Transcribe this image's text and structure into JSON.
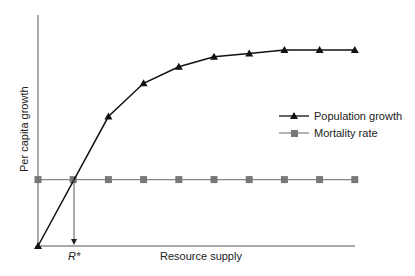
{
  "chart_data": {
    "type": "line",
    "title": "",
    "xlabel": "Resource supply",
    "ylabel": "Per capita growth",
    "x": [
      0,
      1,
      2,
      3,
      4,
      5,
      6,
      7,
      8,
      9
    ],
    "series": [
      {
        "name": "Population growth",
        "marker": "triangle",
        "color": "#111111",
        "values": [
          0,
          null,
          3.9,
          4.9,
          5.4,
          5.7,
          5.8,
          5.9,
          5.9,
          5.9
        ]
      },
      {
        "name": "Mortality rate",
        "marker": "square",
        "color": "#777777",
        "values": [
          2,
          2,
          2,
          2,
          2,
          2,
          2,
          2,
          2,
          2
        ]
      }
    ],
    "annotations": [
      {
        "label": "R*",
        "x": 1,
        "note": "arrow from intersection down to x-axis"
      }
    ],
    "ticks": "none",
    "grid": false,
    "legend_position": "right-middle"
  },
  "legend": {
    "items": [
      {
        "label": "Population growth"
      },
      {
        "label": "Mortality rate"
      }
    ]
  },
  "annotation_label": "R*"
}
